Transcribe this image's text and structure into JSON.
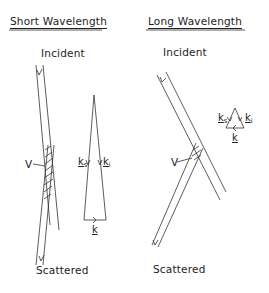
{
  "panels": {
    "short": {
      "title": "Short Wavelength",
      "incident_label": "Incident",
      "scattered_label": "Scattered",
      "volume_label": "V",
      "vectors": {
        "ks": "k",
        "ks_sub": "s",
        "ki": "k",
        "ki_sub": "i",
        "k": "k"
      }
    },
    "long": {
      "title": "Long Wavelength",
      "incident_label": "Incident",
      "scattered_label": "Scattered",
      "volume_label": "V",
      "vectors": {
        "ks": "k",
        "ks_sub": "s",
        "ki": "k",
        "ki_sub": "i",
        "k": "k"
      }
    }
  },
  "colors": {
    "line": "#333333",
    "background": "#ffffff"
  }
}
